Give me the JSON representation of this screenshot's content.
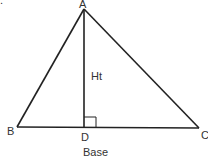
{
  "diagram": {
    "type": "triangle-height-base",
    "stroke_color": "#222222",
    "text_color": "#333333",
    "background": "#ffffff",
    "corner_fragment": ".",
    "vertices": {
      "A": {
        "label": "A",
        "x": 84,
        "y": 9
      },
      "B": {
        "label": "B",
        "x": 17,
        "y": 127
      },
      "C": {
        "label": "C",
        "x": 199,
        "y": 128
      },
      "D": {
        "label": "D",
        "x": 84,
        "y": 127
      }
    },
    "height_label": "Ht",
    "base_label": "Base",
    "right_angle_marker_at": "D"
  }
}
